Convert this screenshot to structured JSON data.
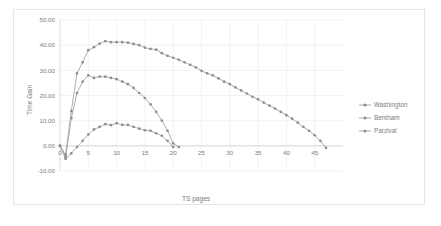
{
  "chart_data": {
    "type": "line",
    "title": "",
    "xlabel": "TS pages",
    "ylabel": "Time Gain",
    "xlim": [
      0,
      50
    ],
    "ylim": [
      -10,
      50
    ],
    "grid": true,
    "legend_position": "right",
    "xticks": [
      "0",
      "5",
      "10",
      "15",
      "20",
      "25",
      "30",
      "35",
      "40",
      "45"
    ],
    "xtick_values": [
      0,
      5,
      10,
      15,
      20,
      25,
      30,
      35,
      40,
      45
    ],
    "yticks": [
      "-10.00",
      "0.00",
      "10.00",
      "20.00",
      "30.00",
      "40.00",
      "50.00"
    ],
    "ytick_values": [
      -10,
      0,
      10,
      20,
      30,
      40,
      50
    ],
    "series": [
      {
        "name": "Washington",
        "color": "#8e8e8e",
        "x": [
          0,
          1,
          2,
          3,
          4,
          5,
          6,
          7,
          8,
          9,
          10,
          11,
          12,
          13,
          14,
          15,
          16,
          17,
          18,
          19,
          20,
          21,
          22,
          23,
          24,
          25,
          26,
          27,
          28,
          29,
          30,
          31,
          32,
          33,
          34,
          35,
          36,
          37,
          38,
          39,
          40,
          41,
          42,
          43,
          44,
          45,
          46,
          47
        ],
        "values": [
          0.0,
          -4.5,
          11.0,
          21.0,
          25.5,
          28.0,
          27.0,
          27.5,
          27.5,
          27.0,
          26.5,
          25.5,
          24.5,
          23.0,
          21.0,
          19.0,
          16.5,
          13.5,
          10.0,
          6.0,
          1.0,
          -0.5,
          0,
          0,
          0,
          0,
          0,
          0,
          0,
          0,
          0,
          0,
          0,
          0,
          0,
          0,
          0,
          0,
          0,
          0,
          0,
          0,
          0,
          0,
          0,
          0,
          0,
          0
        ],
        "n_points": 22
      },
      {
        "name": "Bentham",
        "color": "#8e8e8e",
        "x": [
          0,
          1,
          2,
          3,
          4,
          5,
          6,
          7,
          8,
          9,
          10,
          11,
          12,
          13,
          14,
          15,
          16,
          17,
          18,
          19,
          20
        ],
        "values": [
          0.0,
          -5.2,
          -3.0,
          -0.5,
          2.0,
          4.5,
          6.5,
          7.5,
          8.6,
          8.2,
          9.0,
          8.3,
          8.3,
          7.5,
          6.8,
          6.2,
          6.0,
          5.0,
          4.0,
          2.0,
          -0.5
        ],
        "n_points": 21
      },
      {
        "name": "Parzival",
        "color": "#8e8e8e",
        "x": [
          0,
          1,
          2,
          3,
          4,
          5,
          6,
          7,
          8,
          9,
          10,
          11,
          12,
          13,
          14,
          15,
          16,
          17,
          18,
          19,
          20,
          21,
          22,
          23,
          24,
          25,
          26,
          27,
          28,
          29,
          30,
          31,
          32,
          33,
          34,
          35,
          36,
          37,
          38,
          39,
          40,
          41,
          42,
          43,
          44,
          45,
          46,
          47
        ],
        "values": [
          0.0,
          -3.5,
          13.8,
          28.8,
          33.2,
          38.0,
          39.2,
          40.6,
          41.6,
          41.2,
          41.2,
          41.2,
          41.0,
          40.5,
          40.0,
          39.0,
          38.5,
          38.2,
          36.8,
          35.8,
          35.0,
          34.2,
          33.2,
          32.2,
          31.2,
          29.8,
          28.8,
          28.0,
          26.8,
          25.5,
          24.5,
          23.2,
          22.0,
          20.8,
          19.5,
          18.5,
          17.2,
          16.0,
          14.8,
          13.5,
          12.2,
          10.8,
          9.2,
          7.5,
          6.0,
          4.2,
          2.0,
          -0.8
        ],
        "n_points": 48
      }
    ]
  },
  "legend": {
    "entries": [
      {
        "label": "Washington"
      },
      {
        "label": "Bentham"
      },
      {
        "label": "Parzival"
      }
    ]
  },
  "axes": {
    "x_title": "TS pages",
    "y_title": "Time Gain"
  }
}
